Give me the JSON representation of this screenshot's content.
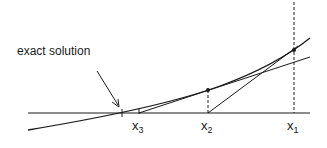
{
  "diagram": {
    "annotation": "exact solution",
    "labels": [
      {
        "name": "x",
        "sub": "3"
      },
      {
        "name": "x",
        "sub": "2"
      },
      {
        "name": "x",
        "sub": "1"
      }
    ],
    "elements": {
      "x_axis": "horizontal axis",
      "curve": "function curve f(x)",
      "tangent_x1": "tangent line at x1 meeting axis at x2",
      "tangent_x2": "tangent line at x2 meeting axis at x3",
      "dashed_x1": "vertical dashed line at x1",
      "dashed_x2": "vertical dashed line at x2"
    },
    "colors": {
      "line": "#1a1a1a",
      "background": "#ffffff"
    }
  }
}
